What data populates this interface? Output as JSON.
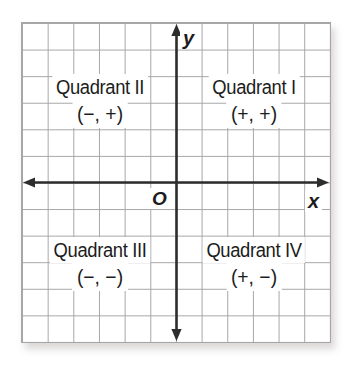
{
  "figure": {
    "type": "coordinate-plane-quadrants",
    "x_axis_label": "x",
    "y_axis_label": "y",
    "origin_label": "O",
    "quadrants": {
      "top_right": {
        "name": "Quadrant I",
        "signs": "(+, +)"
      },
      "top_left": {
        "name": "Quadrant II",
        "signs": "(−, +)"
      },
      "bottom_left": {
        "name": "Quadrant III",
        "signs": "(−, −)"
      },
      "bottom_right": {
        "name": "Quadrant IV",
        "signs": "(+, −)"
      }
    },
    "grid": {
      "columns": 12,
      "rows": 12
    },
    "colors": {
      "background": "#ffffff",
      "grid_line": "#a6a6a6",
      "axis": "#2d2d2d",
      "text": "#1c1c1c"
    }
  }
}
